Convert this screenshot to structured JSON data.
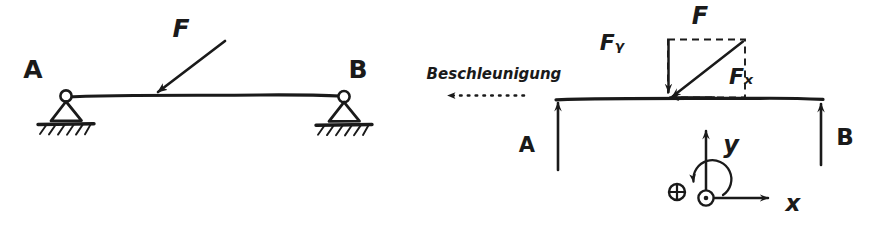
{
  "figure": {
    "style": "hand-drawn pencil sketch",
    "background_color": "#ffffff",
    "ink_color": "#1a1a1a",
    "width": 878,
    "height": 227
  },
  "left_diagram": {
    "name": "beam-on-two-supports",
    "support_a_label": "A",
    "support_b_label": "B",
    "force_label": "F",
    "support_type": "pin-support-triangle-with-hatched-ground",
    "force_direction": "down-left",
    "force_angle_deg": 215
  },
  "right_diagram": {
    "name": "free-body-diagram",
    "acceleration_label": "Beschleunigung",
    "acceleration_direction": "left",
    "resultant_force_label": "F",
    "force_y_label": "Fᵧ",
    "force_x_label": "Fₓ",
    "force_y_plain": "Fy",
    "force_x_plain": "Fx",
    "reaction_a_label": "A",
    "reaction_b_label": "B",
    "reaction_a_direction": "up",
    "reaction_b_direction": "up",
    "force_decomposition": "dashed-rectangle-parallelogram"
  },
  "coordinate_system": {
    "name": "coordinate-axes",
    "x_axis_label": "x",
    "y_axis_label": "y",
    "z_axis_symbol": "⊙",
    "plus_symbol": "⊕",
    "rotation_direction": "counter-clockwise",
    "x_axis_direction": "right",
    "y_axis_direction": "up"
  }
}
